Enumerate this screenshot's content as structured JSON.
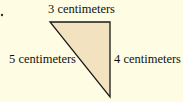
{
  "diagram": {
    "type": "right-triangle",
    "labels": {
      "top": "3 centimeters",
      "left": "5 centimeters",
      "right": "4 centimeters"
    },
    "colors": {
      "fill": "#f3e2c0",
      "stroke": "#1a1a1a",
      "background": "#fefde4"
    }
  }
}
